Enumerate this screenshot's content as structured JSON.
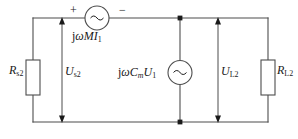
{
  "diagram": {
    "type": "electrical-circuit-schematic",
    "canvas": {
      "width": 298,
      "height": 139
    },
    "colors": {
      "wire": "#4d4d4d",
      "text": "#1a1a1a",
      "background": "#ffffff",
      "node": "#1a1a1a"
    },
    "polarity": {
      "plus": "+",
      "minus": "−"
    },
    "components": {
      "left_resistor": {
        "symbol": "R",
        "subscript": "s2",
        "label_text": "Rs2",
        "kind": "resistor"
      },
      "right_resistor": {
        "symbol": "R",
        "subscript": "L2",
        "label_text": "RL2",
        "kind": "resistor"
      },
      "top_source": {
        "kind": "ac-voltage-source",
        "glyph": "~",
        "expression_prefix": "j",
        "expression_omega": "ω",
        "expression_main": "MI",
        "expression_subscript": "1",
        "label_text": "jωMI1"
      },
      "middle_source": {
        "kind": "ac-current-source",
        "glyph": "~",
        "expression_prefix": "j",
        "expression_omega": "ω",
        "expression_c": "C",
        "expression_c_subscript": "m",
        "expression_u": "U",
        "expression_u_subscript": "1",
        "label_text": "jωCmU1"
      }
    },
    "voltage_markers": {
      "left": {
        "symbol": "U",
        "subscript": "s2",
        "label_text": "Us2",
        "kind": "voltage-arrow-double"
      },
      "right": {
        "symbol": "U",
        "subscript": "L2",
        "label_text": "UL2",
        "kind": "voltage-arrow-double"
      }
    },
    "nodes": [
      {
        "name": "top-junction",
        "x": 180,
        "y": 18
      },
      {
        "name": "bottom-junction",
        "x": 180,
        "y": 122
      }
    ]
  }
}
